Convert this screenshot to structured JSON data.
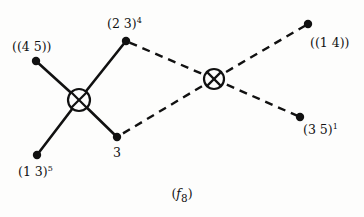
{
  "figure": {
    "caption_open": "(",
    "caption_symbol": "f",
    "caption_subscript": "8",
    "caption_close": ")",
    "background_color": "#fdfdfc",
    "ink_color": "#111111"
  },
  "diagram": {
    "type": "knot-theory-crossing-diagram",
    "crossings": [
      {
        "id": "left-crossing",
        "x": 79,
        "y": 100,
        "radius": 11,
        "style": "solid"
      },
      {
        "id": "right-crossing",
        "x": 214,
        "y": 79,
        "radius": 10,
        "style": "dashed"
      }
    ],
    "endpoints": [
      {
        "id": "endpoint-45",
        "label": "((4 5))",
        "label_base": "((4 5))",
        "label_sup": "",
        "x": 36,
        "y": 61,
        "label_x": 12,
        "label_y": 41
      },
      {
        "id": "endpoint-13",
        "label": "(1 3)5",
        "label_base": "(1 3)",
        "label_sup": "5",
        "x": 37,
        "y": 155,
        "label_x": 18,
        "label_y": 166
      },
      {
        "id": "endpoint-23",
        "label": "(2 3)4",
        "label_base": "(2 3)",
        "label_sup": "4",
        "x": 126,
        "y": 41,
        "label_x": 107,
        "label_y": 18
      },
      {
        "id": "endpoint-3",
        "label": "3",
        "label_base": "3",
        "label_sup": "",
        "x": 117,
        "y": 137,
        "label_x": 113,
        "label_y": 147
      },
      {
        "id": "endpoint-14",
        "label": "((1 4))",
        "label_base": "((1 4))",
        "label_sup": "",
        "x": 308,
        "y": 24,
        "label_x": 310,
        "label_y": 37
      },
      {
        "id": "endpoint-35",
        "label": "(3 5)1",
        "label_base": "(3 5)",
        "label_sup": "1",
        "x": 300,
        "y": 117,
        "label_x": 303,
        "label_y": 124
      }
    ],
    "edges": [
      {
        "id": "edge-left-to-45",
        "from": "left-crossing",
        "to": "endpoint-45",
        "style": "solid"
      },
      {
        "id": "edge-left-to-13",
        "from": "left-crossing",
        "to": "endpoint-13",
        "style": "solid"
      },
      {
        "id": "edge-left-to-23",
        "from": "left-crossing",
        "to": "endpoint-23",
        "style": "solid"
      },
      {
        "id": "edge-left-to-3",
        "from": "left-crossing",
        "to": "endpoint-3",
        "style": "solid"
      },
      {
        "id": "edge-right-to-23",
        "from": "right-crossing",
        "to": "endpoint-23",
        "style": "dashed"
      },
      {
        "id": "edge-right-to-3",
        "from": "right-crossing",
        "to": "endpoint-3",
        "style": "dashed"
      },
      {
        "id": "edge-right-to-14",
        "from": "right-crossing",
        "to": "endpoint-14",
        "style": "dashed"
      },
      {
        "id": "edge-right-to-35",
        "from": "right-crossing",
        "to": "endpoint-35",
        "style": "dashed"
      }
    ]
  }
}
